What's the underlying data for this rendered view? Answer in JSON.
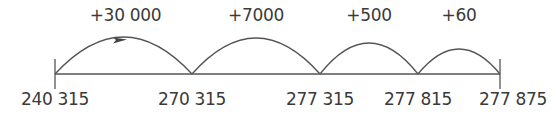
{
  "diagram": {
    "type": "number-line-jumps",
    "line_color": "#555555",
    "text_color": "#3a3a3a",
    "points": [
      {
        "label": "240 315",
        "value": 240315,
        "x": 55
      },
      {
        "label": "270 315",
        "value": 270315,
        "x": 192
      },
      {
        "label": "277 315",
        "value": 277315,
        "x": 320
      },
      {
        "label": "277 815",
        "value": 277815,
        "x": 418
      },
      {
        "label": "277 875",
        "value": 277875,
        "x": 500
      }
    ],
    "jumps": [
      {
        "label": "+30 000",
        "from": 240315,
        "to": 270315,
        "x1": 55,
        "x2": 192,
        "peak_y": 37,
        "arrow": true
      },
      {
        "label": "+7000",
        "from": 270315,
        "to": 277315,
        "x1": 192,
        "x2": 320,
        "peak_y": 38,
        "arrow": false
      },
      {
        "label": "+500",
        "from": 277315,
        "to": 277815,
        "x1": 320,
        "x2": 418,
        "peak_y": 43,
        "arrow": false
      },
      {
        "label": "+60",
        "from": 277815,
        "to": 277875,
        "x1": 418,
        "x2": 500,
        "peak_y": 49,
        "arrow": false
      }
    ]
  }
}
